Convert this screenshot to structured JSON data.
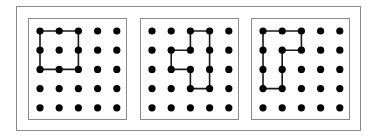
{
  "figure": {
    "grid": {
      "rows": 5,
      "cols": 5
    },
    "colors": {
      "frame": "#8a8a8a",
      "dot": "#000000",
      "path": "#1a1a1a"
    },
    "panels": [
      {
        "id": "panel-1",
        "left": 28,
        "shape": "square",
        "path": [
          [
            0,
            0
          ],
          [
            2,
            0
          ],
          [
            2,
            2
          ],
          [
            0,
            2
          ],
          [
            0,
            0
          ]
        ]
      },
      {
        "id": "panel-2",
        "left": 140,
        "shape": "stepped-loop",
        "path": [
          [
            2,
            0
          ],
          [
            3,
            0
          ],
          [
            3,
            3
          ],
          [
            2,
            3
          ],
          [
            2,
            2
          ],
          [
            1,
            2
          ],
          [
            1,
            1
          ],
          [
            2,
            1
          ],
          [
            2,
            0
          ]
        ]
      },
      {
        "id": "panel-3",
        "left": 251,
        "shape": "hook-loop",
        "path": [
          [
            0,
            0
          ],
          [
            2,
            0
          ],
          [
            2,
            1
          ],
          [
            1,
            1
          ],
          [
            1,
            3
          ],
          [
            0,
            3
          ],
          [
            0,
            0
          ]
        ]
      }
    ]
  }
}
